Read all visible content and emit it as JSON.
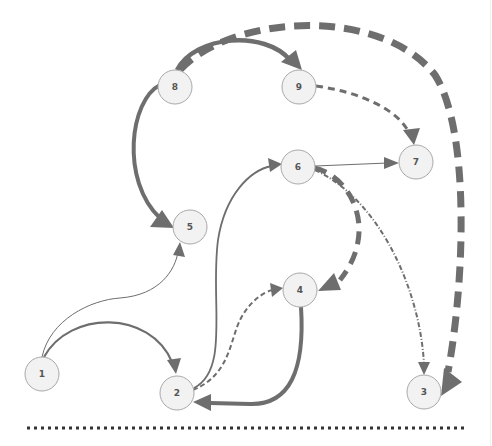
{
  "diagram": {
    "type": "directed-graph",
    "colors": {
      "edge": "#6e6e6e",
      "node_fill": "#f2f2f2",
      "node_stroke": "#a8a8a8",
      "label": "#555555",
      "divider": "#333333"
    },
    "nodes": [
      {
        "id": "8",
        "label": "8",
        "x": 175,
        "y": 87
      },
      {
        "id": "9",
        "label": "9",
        "x": 299,
        "y": 87
      },
      {
        "id": "6",
        "label": "6",
        "x": 298,
        "y": 167
      },
      {
        "id": "7",
        "label": "7",
        "x": 416,
        "y": 162
      },
      {
        "id": "5",
        "label": "5",
        "x": 190,
        "y": 227
      },
      {
        "id": "4",
        "label": "4",
        "x": 300,
        "y": 290
      },
      {
        "id": "1",
        "label": "1",
        "x": 42,
        "y": 374
      },
      {
        "id": "2",
        "label": "2",
        "x": 177,
        "y": 393
      },
      {
        "id": "3",
        "label": "3",
        "x": 424,
        "y": 392
      }
    ],
    "edges": [
      {
        "from": "8",
        "to": "9",
        "style": "solid",
        "weight": "thick"
      },
      {
        "from": "8",
        "to": "3",
        "style": "dashed",
        "weight": "very-thick"
      },
      {
        "from": "8",
        "to": "5",
        "style": "solid",
        "weight": "thick"
      },
      {
        "from": "9",
        "to": "7",
        "style": "dashed",
        "weight": "medium"
      },
      {
        "from": "6",
        "to": "7",
        "style": "solid",
        "weight": "thin"
      },
      {
        "from": "6",
        "to": "4",
        "style": "dashed",
        "weight": "thick"
      },
      {
        "from": "6",
        "to": "3",
        "style": "dash-dot",
        "weight": "medium"
      },
      {
        "from": "1",
        "to": "5",
        "style": "solid",
        "weight": "thin"
      },
      {
        "from": "1",
        "to": "2",
        "style": "solid",
        "weight": "medium"
      },
      {
        "from": "2",
        "to": "6",
        "style": "solid",
        "weight": "medium"
      },
      {
        "from": "2",
        "to": "4",
        "style": "dashed",
        "weight": "medium"
      },
      {
        "from": "4",
        "to": "2",
        "style": "solid",
        "weight": "thick"
      }
    ],
    "divider": {
      "style": "dotted",
      "y": 428
    }
  }
}
